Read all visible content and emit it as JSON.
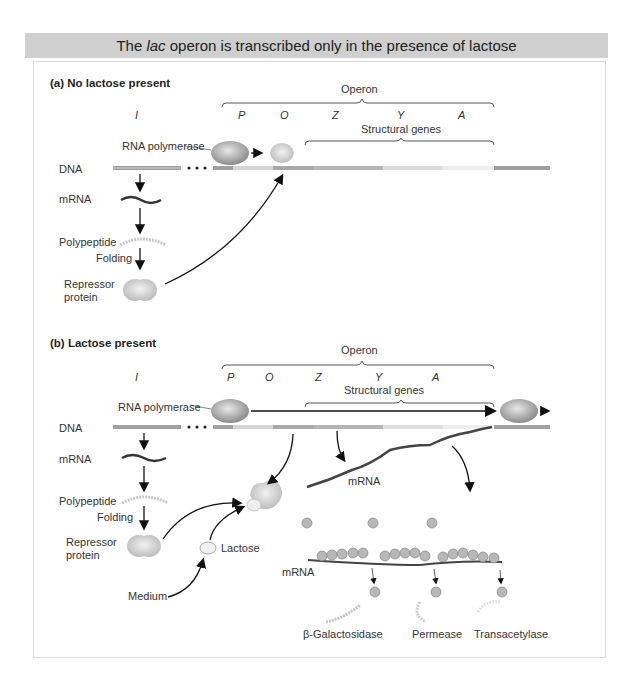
{
  "title": {
    "prefix": "The ",
    "italic": "lac",
    "suffix": " operon is transcribed only in the presence of lactose"
  },
  "panel_a": {
    "heading": "(a)  No lactose present",
    "operon_label": "Operon",
    "genes": [
      "I",
      "P",
      "O",
      "Z",
      "Y",
      "A"
    ],
    "structural_genes_label": "Structural genes",
    "rna_polymerase_label": "RNA polymerase",
    "dna_label": "DNA",
    "mrna_label": "mRNA",
    "polypeptide_label": "Polypeptide",
    "folding_label": "Folding",
    "repressor_label_line1": "Repressor",
    "repressor_label_line2": "protein"
  },
  "panel_b": {
    "heading": "(b)  Lactose present",
    "operon_label": "Operon",
    "genes": [
      "I",
      "P",
      "O",
      "Z",
      "Y",
      "A"
    ],
    "structural_genes_label": "Structural genes",
    "rna_polymerase_label": "RNA polymerase",
    "dna_label": "DNA",
    "mrna_label": "mRNA",
    "polypeptide_label": "Polypeptide",
    "folding_label": "Folding",
    "repressor_label_line1": "Repressor",
    "repressor_label_line2": "protein",
    "lactose_label": "Lactose",
    "medium_label": "Medium",
    "long_mrna_label": "mRNA",
    "ribosome_mrna_label": "mRNA",
    "products": [
      "β-Galactosidase",
      "Permease",
      "Transacetylase"
    ]
  }
}
